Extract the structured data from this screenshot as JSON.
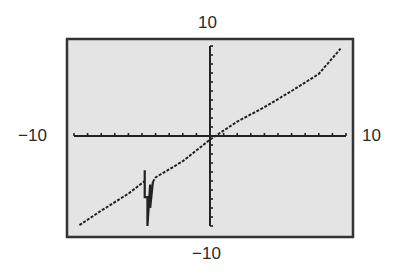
{
  "window": {
    "xmin": -10,
    "xmax": 10,
    "ymin": -10,
    "ymax": 10,
    "xscl": 1,
    "yscl": 1
  },
  "labels": {
    "ymax": "10",
    "ymin": "−10",
    "xmin": "−10",
    "xmax": "10"
  },
  "colors": {
    "screen_bg": "#e4e4e4",
    "frame": "#333333",
    "plot": "#222222",
    "label": "#2a2a2a"
  },
  "chart_data": {
    "type": "line",
    "title": "",
    "xlabel": "",
    "ylabel": "",
    "xlim": [
      -10,
      10
    ],
    "ylim": [
      -10,
      10
    ],
    "grid": false,
    "series": [
      {
        "name": "graph",
        "points": [
          [
            -9.6,
            -9.9
          ],
          [
            -8,
            -8.3
          ],
          [
            -6,
            -6.4
          ],
          [
            -4.8,
            -5.0
          ],
          [
            -4.8,
            -3.8
          ],
          [
            -4.8,
            -6.8
          ],
          [
            -4.6,
            -6.8
          ],
          [
            -4.6,
            -10.0
          ],
          [
            -4.4,
            -5.4
          ],
          [
            -4.4,
            -8.0
          ],
          [
            -4.2,
            -5.1
          ],
          [
            -4,
            -4.6
          ],
          [
            -2,
            -2.8
          ],
          [
            0,
            -0.4
          ],
          [
            2,
            1.6
          ],
          [
            4,
            3.2
          ],
          [
            6,
            5.0
          ],
          [
            8,
            6.9
          ],
          [
            9.6,
            9.7
          ]
        ]
      }
    ]
  }
}
